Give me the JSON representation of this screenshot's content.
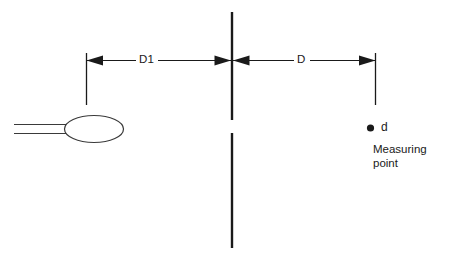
{
  "diagram": {
    "colors": {
      "line": "#1a1a1a",
      "antenna_outline": "#3a3a3a",
      "background": "#ffffff",
      "text": "#1a1a1a"
    },
    "dimensions": [
      {
        "id": "d1",
        "label": "D1",
        "from": "antenna-reference",
        "to": "center-reference-line"
      },
      {
        "id": "d",
        "label": "D",
        "from": "center-reference-line",
        "to": "measuring-point-reference"
      }
    ],
    "measuring_point": {
      "marker_label": "d",
      "caption_line_1": "Measuring",
      "caption_line_2": "point"
    },
    "antenna": {
      "name": "loop-antenna"
    },
    "reference_line": {
      "name": "center-reference-line"
    }
  }
}
